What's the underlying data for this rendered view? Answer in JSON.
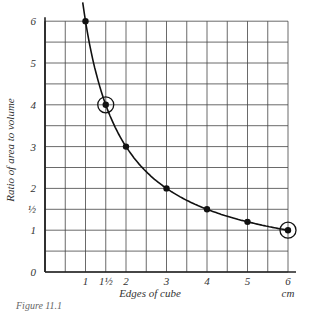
{
  "chart_data": {
    "type": "line",
    "title": "",
    "xlabel": "Edges of cube",
    "xunit": "cm",
    "ylabel": "Ratio of area to volume",
    "xlim": [
      0,
      6
    ],
    "ylim": [
      0,
      6
    ],
    "grid": true,
    "grid_step": 0.5,
    "x_ticks": [
      {
        "value": 1,
        "label": "1"
      },
      {
        "value": 1.5,
        "label": "1½"
      },
      {
        "value": 2,
        "label": "2"
      },
      {
        "value": 3,
        "label": "3"
      },
      {
        "value": 4,
        "label": "4"
      },
      {
        "value": 5,
        "label": "5"
      },
      {
        "value": 6,
        "label": "6"
      }
    ],
    "y_ticks": [
      {
        "value": 0,
        "label": "0"
      },
      {
        "value": 1,
        "label": "1"
      },
      {
        "value": 1.5,
        "label": "½"
      },
      {
        "value": 2,
        "label": "2"
      },
      {
        "value": 3,
        "label": "3"
      },
      {
        "value": 4,
        "label": "4"
      },
      {
        "value": 5,
        "label": "5"
      },
      {
        "value": 6,
        "label": "6"
      }
    ],
    "series": [
      {
        "name": "Ratio of area to volume",
        "x": [
          1,
          1.5,
          2,
          3,
          4,
          5,
          6
        ],
        "y": [
          6,
          4,
          3,
          2,
          1.5,
          1.2,
          1
        ],
        "circled": [
          false,
          true,
          false,
          false,
          false,
          false,
          true
        ]
      }
    ],
    "annotations": [
      "Circled points at (1½, 4) and (6, 1)"
    ]
  },
  "caption": "Figure 11.1"
}
